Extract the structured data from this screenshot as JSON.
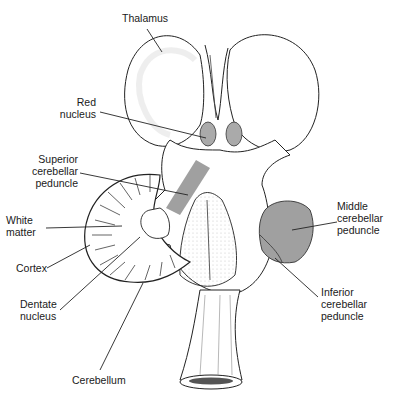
{
  "figure": {
    "colors": {
      "outline": "#222222",
      "highlight": "#a0a0a0",
      "stipple": "#cfcfcf",
      "background": "#ffffff"
    }
  },
  "labels": {
    "thalamus": "Thalamus",
    "red_nucleus": "Red\nnucleus",
    "superior_peduncle": "Superior\ncerebellar\npeduncle",
    "white_matter": "White\nmatter",
    "cortex": "Cortex",
    "dentate": "Dentate\nnucleus",
    "cerebellum": "Cerebellum",
    "middle_peduncle": "Middle\ncerebellar\npeduncle",
    "inferior_peduncle": "Inferior\ncerebellar\npeduncle"
  }
}
